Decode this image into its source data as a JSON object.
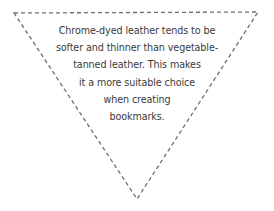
{
  "diagram": {
    "shape": "inverted-triangle",
    "border_style": "dashed",
    "border_color": "#6e6e6e",
    "text_color": "#3a3a3a",
    "vertices": {
      "top_left": [
        14,
        13
      ],
      "top_right": [
        258,
        12
      ],
      "bottom": [
        137,
        199
      ]
    },
    "lines": [
      "Chrome-dyed leather tends to be",
      "softer and thinner than vegetable-",
      "tanned leather. This makes",
      "it a more suitable choice",
      "when creating",
      "bookmarks."
    ]
  }
}
